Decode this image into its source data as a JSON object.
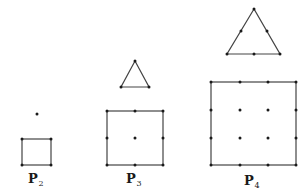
{
  "figure": {
    "background": "#ffffff",
    "line_color": "#444444",
    "point_color": "#1a1a1a",
    "panels": [
      {
        "id": "P2",
        "label": "P",
        "subscript": "2",
        "label_pos": [
          37,
          183
        ],
        "triangle": {
          "vertices": [],
          "points": [
            [
              37,
              114
            ]
          ]
        },
        "square": {
          "x": 22,
          "y": 139,
          "size_w": 29,
          "size_h": 26,
          "points": [
            [
              22,
              139
            ],
            [
              51,
              139
            ],
            [
              22,
              165
            ],
            [
              51,
              165
            ]
          ]
        }
      },
      {
        "id": "P3",
        "label": "P",
        "subscript": "3",
        "label_pos": [
          135,
          183
        ],
        "triangle": {
          "vertices": [
            [
              135,
              61
            ],
            [
              121,
              87
            ],
            [
              149,
              87
            ]
          ],
          "points": [
            [
              135,
              61
            ],
            [
              121,
              87
            ],
            [
              149,
              87
            ]
          ]
        },
        "square": {
          "x": 107,
          "y": 111,
          "size_w": 56,
          "size_h": 54,
          "points": [
            [
              107,
              111
            ],
            [
              135,
              111
            ],
            [
              163,
              111
            ],
            [
              107,
              138
            ],
            [
              135,
              138
            ],
            [
              163,
              138
            ],
            [
              107,
              165
            ],
            [
              135,
              165
            ],
            [
              163,
              165
            ]
          ]
        }
      },
      {
        "id": "P4",
        "label": "P",
        "subscript": "4",
        "label_pos": [
          253,
          185
        ],
        "triangle": {
          "vertices": [
            [
              254,
              9
            ],
            [
              227,
              54
            ],
            [
              280,
              54
            ]
          ],
          "points": [
            [
              254,
              9
            ],
            [
              241,
              31
            ],
            [
              267,
              31
            ],
            [
              227,
              54
            ],
            [
              254,
              54
            ],
            [
              280,
              54
            ]
          ]
        },
        "square": {
          "x": 211,
          "y": 82,
          "size_w": 85,
          "size_h": 83,
          "points": [
            [
              211,
              82
            ],
            [
              240,
              82
            ],
            [
              268,
              82
            ],
            [
              296,
              82
            ],
            [
              211,
              110
            ],
            [
              240,
              110
            ],
            [
              268,
              110
            ],
            [
              296,
              110
            ],
            [
              211,
              138
            ],
            [
              240,
              138
            ],
            [
              268,
              138
            ],
            [
              296,
              138
            ],
            [
              211,
              165
            ],
            [
              240,
              165
            ],
            [
              268,
              165
            ],
            [
              296,
              165
            ]
          ]
        }
      }
    ]
  }
}
